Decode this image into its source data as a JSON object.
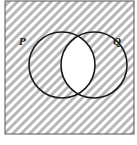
{
  "diagram": {
    "type": "venn",
    "sets": [
      {
        "label": "P",
        "cx": 62,
        "cy": 65,
        "r": 33
      },
      {
        "label": "Q",
        "cx": 94,
        "cy": 65,
        "r": 33
      }
    ],
    "shaded_region": "complement of P ∩ Q",
    "unshaded_region": "P ∩ Q",
    "colors": {
      "hatch": "#b8b8b8",
      "background": "#ffffff",
      "stroke": "#1a1a1a"
    }
  }
}
